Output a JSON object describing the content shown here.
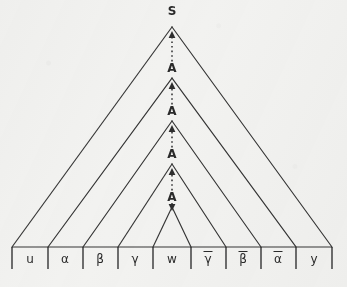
{
  "figure": {
    "background_color": "#f2f2f0",
    "ink_color": "#343434"
  },
  "root": {
    "label": "S",
    "x": 172,
    "y": 15
  },
  "derivation_nodes": [
    {
      "label": "A",
      "x": 172,
      "y": 72
    },
    {
      "label": "A",
      "x": 172,
      "y": 115
    },
    {
      "label": "A",
      "x": 172,
      "y": 158
    },
    {
      "label": "A",
      "x": 172,
      "y": 201
    }
  ],
  "triangles": [
    {
      "apex_x": 172,
      "apex_y": 27,
      "left_x": 12,
      "right_x": 332,
      "base_y": 247
    },
    {
      "apex_x": 172,
      "apex_y": 78,
      "left_x": 48,
      "right_x": 296,
      "base_y": 247
    },
    {
      "apex_x": 172,
      "apex_y": 121,
      "left_x": 83,
      "right_x": 261,
      "base_y": 247
    },
    {
      "apex_x": 172,
      "apex_y": 164,
      "left_x": 118,
      "right_x": 226,
      "base_y": 247
    },
    {
      "apex_x": 172,
      "apex_y": 207,
      "left_x": 153,
      "right_x": 191,
      "base_y": 247
    }
  ],
  "arrows": [
    {
      "from_y": 66,
      "to_y": 31
    },
    {
      "from_y": 109,
      "to_y": 82
    },
    {
      "from_y": 152,
      "to_y": 125
    },
    {
      "from_y": 195,
      "to_y": 168
    },
    {
      "from_y": 203,
      "to_y": 211
    }
  ],
  "baseline": {
    "y": 247,
    "x_start": 12,
    "x_end": 332,
    "tick_height": 22,
    "tick_positions": [
      12,
      48,
      83,
      118,
      153,
      191,
      226,
      261,
      296,
      332
    ]
  },
  "leaves": [
    {
      "label": "u",
      "overbar": false,
      "x": 30,
      "y": 263
    },
    {
      "label": "α",
      "overbar": false,
      "x": 65,
      "y": 263
    },
    {
      "label": "β",
      "overbar": false,
      "x": 100,
      "y": 263
    },
    {
      "label": "γ",
      "overbar": false,
      "x": 135,
      "y": 263
    },
    {
      "label": "w",
      "overbar": false,
      "x": 172,
      "y": 263
    },
    {
      "label": "γ",
      "overbar": true,
      "x": 208,
      "y": 263
    },
    {
      "label": "β",
      "overbar": true,
      "x": 243,
      "y": 263
    },
    {
      "label": "α",
      "overbar": true,
      "x": 278,
      "y": 263
    },
    {
      "label": "y",
      "overbar": false,
      "x": 314,
      "y": 263
    }
  ]
}
